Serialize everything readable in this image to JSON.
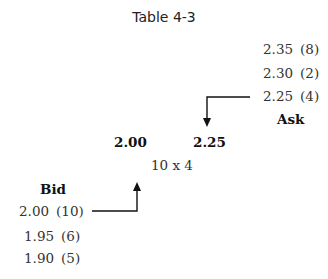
{
  "title": "Table 4-3",
  "ask": {
    "label": "Ask",
    "levels": [
      {
        "price": "2.35",
        "size": "(8)"
      },
      {
        "price": "2.30",
        "size": "(2)"
      },
      {
        "price": "2.25",
        "size": "(4)"
      }
    ]
  },
  "bid": {
    "label": "Bid",
    "levels": [
      {
        "price": "2.00",
        "size": "(10)"
      },
      {
        "price": "1.95",
        "size": "(6)"
      },
      {
        "price": "1.90",
        "size": "(5)"
      }
    ]
  },
  "quote": {
    "bid_price": "2.00",
    "ask_price": "2.25",
    "size": "10 x 4"
  }
}
